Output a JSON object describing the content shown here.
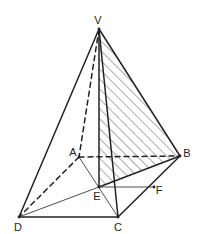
{
  "figure": {
    "stroke_color": "#222222",
    "hatch_color": "#444444",
    "background": "#ffffff",
    "points": {
      "V": {
        "label": "V",
        "x": 99,
        "y": 29,
        "lx": 98,
        "ly": 24,
        "anchor": "middle"
      },
      "A": {
        "label": "A",
        "x": 79,
        "y": 157,
        "lx": 73,
        "ly": 156,
        "anchor": "middle"
      },
      "B": {
        "label": "B",
        "x": 180,
        "y": 156,
        "lx": 187,
        "ly": 157,
        "anchor": "middle"
      },
      "C": {
        "label": "C",
        "x": 118,
        "y": 217,
        "lx": 118,
        "ly": 231,
        "anchor": "middle"
      },
      "D": {
        "label": "D",
        "x": 19,
        "y": 217,
        "lx": 18,
        "ly": 231,
        "anchor": "middle"
      },
      "E": {
        "label": "E",
        "x": 99,
        "y": 187,
        "lx": 97,
        "ly": 200,
        "anchor": "middle"
      },
      "F": {
        "label": "F",
        "x": 154,
        "y": 187,
        "lx": 159,
        "ly": 194,
        "anchor": "middle"
      }
    },
    "segments": [
      {
        "id": "VD",
        "from": "V",
        "to": "D",
        "style": "solid",
        "weight": "thick"
      },
      {
        "id": "VE",
        "from": "V",
        "to": "E",
        "style": "solid",
        "weight": "thick"
      },
      {
        "id": "VC",
        "from": "V",
        "to": "C",
        "style": "solid",
        "weight": "thick"
      },
      {
        "id": "VB",
        "from": "V",
        "to": "B",
        "style": "solid",
        "weight": "thick"
      },
      {
        "id": "DC",
        "from": "D",
        "to": "C",
        "style": "solid",
        "weight": "thick"
      },
      {
        "id": "CB",
        "from": "C",
        "to": "B",
        "style": "solid",
        "weight": "thick"
      },
      {
        "id": "EB",
        "from": "E",
        "to": "B",
        "style": "solid",
        "weight": "thick"
      },
      {
        "id": "EF",
        "from": "E",
        "to": "F",
        "style": "solid",
        "weight": "thin"
      },
      {
        "id": "ED",
        "from": "E",
        "to": "D",
        "style": "solid",
        "weight": "thin"
      },
      {
        "id": "AC",
        "from": "A",
        "to": "C",
        "style": "solid",
        "weight": "thin"
      },
      {
        "id": "VA",
        "from": "V",
        "to": "A",
        "style": "dashed",
        "weight": "thick"
      },
      {
        "id": "AD",
        "from": "A",
        "to": "D",
        "style": "dashed",
        "weight": "thick"
      },
      {
        "id": "AB",
        "from": "A",
        "to": "B",
        "style": "dashed",
        "weight": "thick"
      }
    ],
    "shaded_region": {
      "name": "triangle VEB",
      "vertices": [
        "V",
        "E",
        "B"
      ],
      "fill": "hatch"
    }
  }
}
